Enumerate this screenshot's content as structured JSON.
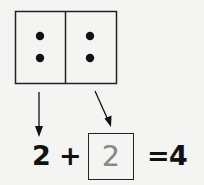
{
  "ten_frame": {
    "cells": [
      {
        "dots": 2
      },
      {
        "dots": 2
      }
    ]
  },
  "equation": {
    "addend_1": "2",
    "operator": "+",
    "addend_2_answer": "2",
    "equals": "=",
    "sum": "4"
  },
  "colors": {
    "ink": "#111111",
    "answer_ink": "#888888",
    "background": "#f4f4f2"
  }
}
